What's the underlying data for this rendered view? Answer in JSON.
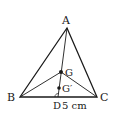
{
  "diagram": {
    "type": "geometry-triangle",
    "vertices": {
      "A": {
        "label": "A",
        "x": 67,
        "y": 28
      },
      "B": {
        "label": "B",
        "x": 20,
        "y": 97
      },
      "C": {
        "label": "C",
        "x": 97,
        "y": 97
      }
    },
    "points": {
      "G": {
        "label": "G",
        "x": 61,
        "y": 72
      },
      "G_prime": {
        "label": "G′",
        "x": 59,
        "y": 88
      },
      "D": {
        "label": "D",
        "x": 58,
        "y": 97
      }
    },
    "measurement": {
      "label": "5 cm"
    },
    "colors": {
      "stroke": "#1a1a1a",
      "background": "#ffffff"
    }
  }
}
